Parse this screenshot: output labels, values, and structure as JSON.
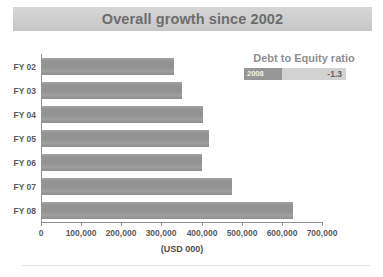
{
  "header": {
    "title": "Overall growth since 2002"
  },
  "callout": {
    "title": "Debt to Equity ratio",
    "year_label": "2008",
    "value_label": "-1.3"
  },
  "axis": {
    "x_title": "(USD 000)"
  },
  "colors": {
    "title_band": "#cfcfcf",
    "title_text": "#6d6d6d",
    "bar": "#949494",
    "axis": "#8f8f8f",
    "tick_text": "#5a5a5a",
    "callout_title": "#8f8f8f",
    "callout_year_bg": "#969696",
    "callout_value_bg": "#d2d2d2",
    "background": "#ffffff"
  },
  "chart_data": {
    "type": "bar",
    "orientation": "horizontal",
    "title": "Overall growth since 2002",
    "xlabel": "(USD 000)",
    "ylabel": "",
    "categories": [
      "FY 02",
      "FY 03",
      "FY 04",
      "FY 05",
      "FY 06",
      "FY 07",
      "FY 08"
    ],
    "values": [
      332000,
      352000,
      404000,
      419000,
      402000,
      476000,
      628000
    ],
    "xlim": [
      0,
      700000
    ],
    "xticks": [
      0,
      100000,
      200000,
      300000,
      400000,
      500000,
      600000,
      700000
    ],
    "xtick_labels": [
      "0",
      "100,000",
      "200,000",
      "300,000",
      "400,000",
      "500,000",
      "600,000",
      "700,000"
    ],
    "grid": false,
    "legend": null,
    "annotations": [
      {
        "text": "Debt to Equity ratio",
        "year": "2008",
        "value": "-1.3"
      }
    ]
  }
}
